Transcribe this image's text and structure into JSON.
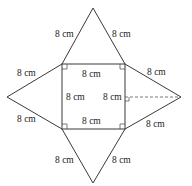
{
  "figure": {
    "type": "net of square-based pyramid",
    "square": {
      "labels": {
        "top": "8 cm",
        "left": "8 cm",
        "right": "8 cm",
        "bottom": "8 cm"
      },
      "right_angle_marks": 4
    },
    "triangles": {
      "top": {
        "left_edge": "8 cm",
        "right_edge": "8 cm"
      },
      "left": {
        "upper_edge": "8 cm",
        "lower_edge": "8 cm"
      },
      "right": {
        "upper_edge": "8 cm",
        "lower_edge": "8 cm",
        "height_line": "dashed"
      },
      "bottom": {
        "left_edge": "8 cm",
        "right_edge": "8 cm"
      }
    }
  }
}
